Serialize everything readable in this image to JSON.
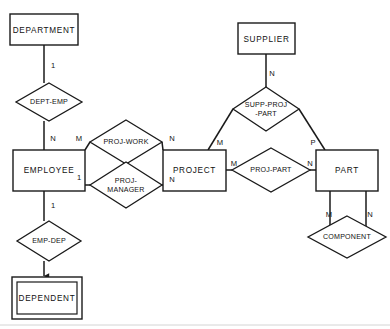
{
  "diagram": {
    "kind": "er-diagram",
    "title": "",
    "stroke_color": "#1a1a1a",
    "background_color": "#ffffff",
    "entities": [
      {
        "id": "department",
        "label": "DEPARTMENT",
        "weak": false,
        "x": 10,
        "y": 14,
        "w": 68,
        "h": 31
      },
      {
        "id": "employee",
        "label": "EMPLOYEE",
        "weak": false,
        "x": 13,
        "y": 150,
        "w": 72,
        "h": 41
      },
      {
        "id": "dependent",
        "label": "DEPENDENT",
        "weak": true,
        "x": 12,
        "y": 277,
        "w": 70,
        "h": 42
      },
      {
        "id": "project",
        "label": "PROJECT",
        "weak": false,
        "x": 163,
        "y": 150,
        "w": 63,
        "h": 41
      },
      {
        "id": "supplier",
        "label": "SUPPLIER",
        "weak": false,
        "x": 238,
        "y": 23,
        "w": 57,
        "h": 31
      },
      {
        "id": "part",
        "label": "PART",
        "weak": false,
        "x": 316,
        "y": 150,
        "w": 62,
        "h": 41
      }
    ],
    "relationships": [
      {
        "id": "dept-emp",
        "lines": [
          "DEPT-EMP"
        ],
        "cx": 49,
        "cy": 102,
        "rx": 33,
        "ry": 19
      },
      {
        "id": "proj-work",
        "lines": [
          "PROJ-WORK"
        ],
        "cx": 126,
        "cy": 142,
        "rx": 36,
        "ry": 22
      },
      {
        "id": "proj-manager",
        "lines": [
          "PROJ-",
          "MANAGER"
        ],
        "cx": 126,
        "cy": 185,
        "rx": 36,
        "ry": 23
      },
      {
        "id": "emp-dep",
        "lines": [
          "EMP-DEP"
        ],
        "cx": 49,
        "cy": 241,
        "rx": 32,
        "ry": 20
      },
      {
        "id": "supp-proj-part",
        "lines": [
          "SUPP-PROJ",
          "-PART"
        ],
        "cx": 266,
        "cy": 109,
        "rx": 33,
        "ry": 22
      },
      {
        "id": "proj-part",
        "lines": [
          "PROJ-PART"
        ],
        "cx": 271,
        "cy": 170,
        "rx": 39,
        "ry": 22
      },
      {
        "id": "component",
        "lines": [
          "COMPONENT"
        ],
        "cx": 347,
        "cy": 237,
        "rx": 39,
        "ry": 21
      }
    ],
    "cardinalities": [
      {
        "id": "dept-emp-dept",
        "text": "1",
        "x": 53,
        "y": 66
      },
      {
        "id": "dept-emp-emp",
        "text": "N",
        "x": 53,
        "y": 139
      },
      {
        "id": "proj-work-emp",
        "text": "M",
        "x": 79,
        "y": 139
      },
      {
        "id": "proj-work-proj",
        "text": "N",
        "x": 172,
        "y": 139
      },
      {
        "id": "proj-manager-emp",
        "text": "1",
        "x": 79,
        "y": 178
      },
      {
        "id": "proj-manager-proj",
        "text": "N",
        "x": 172,
        "y": 180
      },
      {
        "id": "emp-dep-emp",
        "text": "1",
        "x": 53,
        "y": 206
      },
      {
        "id": "supp-proj-part-supp",
        "text": "N",
        "x": 272,
        "y": 74
      },
      {
        "id": "supp-proj-part-proj",
        "text": "M",
        "x": 220,
        "y": 143
      },
      {
        "id": "supp-proj-part-part",
        "text": "P",
        "x": 313,
        "y": 143
      },
      {
        "id": "proj-part-proj",
        "text": "M",
        "x": 234,
        "y": 164
      },
      {
        "id": "proj-part-part",
        "text": "N",
        "x": 310,
        "y": 164
      },
      {
        "id": "component-m",
        "text": "M",
        "x": 329,
        "y": 215
      },
      {
        "id": "component-n",
        "text": "N",
        "x": 370,
        "y": 215
      }
    ]
  }
}
